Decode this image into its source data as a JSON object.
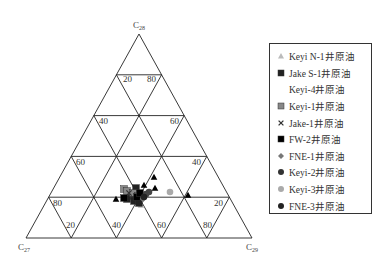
{
  "chart_data": {
    "type": "ternary-scatter",
    "title": "",
    "axes": {
      "top": {
        "label": "C28",
        "sub": "28"
      },
      "left": {
        "label": "C27",
        "sub": "27"
      },
      "right": {
        "label": "C29",
        "sub": "29"
      }
    },
    "grid_ticks": [
      20,
      40,
      60,
      80
    ],
    "tick_labels": [
      {
        "text": "20",
        "x": 123,
        "y": 82
      },
      {
        "text": "80",
        "x": 147,
        "y": 82
      },
      {
        "text": "40",
        "x": 99,
        "y": 124
      },
      {
        "text": "60",
        "x": 170,
        "y": 124
      },
      {
        "text": "60",
        "x": 76,
        "y": 165
      },
      {
        "text": "40",
        "x": 192,
        "y": 165
      },
      {
        "text": "80",
        "x": 53,
        "y": 206
      },
      {
        "text": "20",
        "x": 214,
        "y": 206
      },
      {
        "text": "20",
        "x": 66,
        "y": 228
      },
      {
        "text": "40",
        "x": 112,
        "y": 228
      },
      {
        "text": "60",
        "x": 157,
        "y": 228
      },
      {
        "text": "80",
        "x": 203,
        "y": 228
      }
    ],
    "series": [
      {
        "name": "Keyi N-1井原油",
        "marker": "triangle",
        "color": "#bbbbbb",
        "points": [
          [
            141,
            205
          ]
        ]
      },
      {
        "name": "Jake S-1井原油",
        "marker": "square",
        "color": "#222222",
        "points": [
          [
            136,
            188
          ],
          [
            131,
            196
          ],
          [
            127,
            199
          ],
          [
            134,
            201
          ],
          [
            139,
            203
          ]
        ]
      },
      {
        "name": "Keyi-4井原油",
        "marker": "none",
        "color": "#ffffff",
        "points": []
      },
      {
        "name": "Keyi-1井原油",
        "marker": "square",
        "color": "#888888",
        "points": [
          [
            124,
            189
          ],
          [
            127,
            191
          ],
          [
            133,
            193
          ],
          [
            138,
            196
          ]
        ]
      },
      {
        "name": "Jake-1井原油",
        "marker": "cross",
        "color": "#333333",
        "points": [
          [
            129,
            193
          ]
        ]
      },
      {
        "name": "FW-2井原油",
        "marker": "square",
        "color": "#000000",
        "points": [
          [
            124,
            198
          ],
          [
            137,
            197
          ],
          [
            140,
            193
          ]
        ]
      },
      {
        "name": "FNE-1井原油",
        "marker": "diamond",
        "color": "#777777",
        "points": [
          [
            146,
            196
          ],
          [
            143,
            199
          ]
        ]
      },
      {
        "name": "Keyi-2井原油",
        "marker": "circle",
        "color": "#444444",
        "points": [
          [
            149,
            192
          ],
          [
            146,
            194
          ]
        ]
      },
      {
        "name": "Keyi-3井原油",
        "marker": "circle",
        "color": "#aaaaaa",
        "points": [
          [
            170,
            192
          ]
        ]
      },
      {
        "name": "FNE-3井原油",
        "marker": "circle",
        "color": "#222222",
        "points": [
          [
            144,
            197
          ]
        ]
      },
      {
        "name": "triangle-black",
        "marker": "triangle",
        "color": "#000000",
        "points": [
          [
            116,
            199
          ],
          [
            144,
            185
          ],
          [
            154,
            177
          ],
          [
            155,
            188
          ],
          [
            188,
            195
          ]
        ]
      }
    ]
  },
  "legend": {
    "items": [
      {
        "label": "Keyi N-1井原油",
        "marker": "triangle",
        "color": "#bbbbbb"
      },
      {
        "label": "Jake S-1井原油",
        "marker": "square",
        "color": "#222222"
      },
      {
        "label": "Keyi-4井原油",
        "marker": "none",
        "color": "#ffffff"
      },
      {
        "label": "Keyi-1井原油",
        "marker": "square",
        "color": "#888888"
      },
      {
        "label": "Jake-1井原油",
        "marker": "cross",
        "color": "#333333"
      },
      {
        "label": "FW-2井原油",
        "marker": "square",
        "color": "#000000"
      },
      {
        "label": "FNE-1井原油",
        "marker": "diamond",
        "color": "#777777"
      },
      {
        "label": "Keyi-2井原油",
        "marker": "circle",
        "color": "#333333"
      },
      {
        "label": "Keyi-3井原油",
        "marker": "circle",
        "color": "#aaaaaa"
      },
      {
        "label": "FNE-3井原油",
        "marker": "circle",
        "color": "#222222"
      }
    ]
  }
}
